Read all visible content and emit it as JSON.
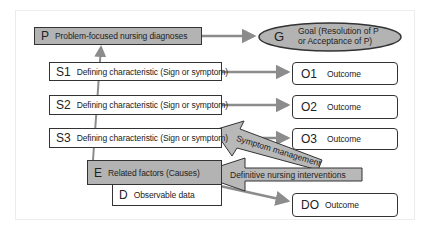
{
  "problem": {
    "code": "P",
    "label": "Problem-focused nursing diagnoses"
  },
  "goal": {
    "code": "G",
    "line1": "Goal (Resolution of P",
    "line2": "or Acceptance of P)"
  },
  "signs": [
    {
      "code": "S1",
      "label": "Defining characteristic (Sign or symptom)"
    },
    {
      "code": "S2",
      "label": "Defining characteristic (Sign or symptom)"
    },
    {
      "code": "S3",
      "label": "Defining characteristic (Sign or symptom)"
    }
  ],
  "outcomes": [
    {
      "code": "O1",
      "label": "Outcome"
    },
    {
      "code": "O2",
      "label": "Outcome"
    },
    {
      "code": "O3",
      "label": "Outcome"
    },
    {
      "code": "DO",
      "label": "Outcome"
    }
  ],
  "etiology": {
    "code": "E",
    "label": "Related factors (Causes)"
  },
  "data": {
    "code": "D",
    "label": "Observable data"
  },
  "interventions": {
    "symptom": "Symptom management",
    "definitive": "Definitive nursing interventions"
  },
  "colors": {
    "gray_fill": "#b3b3b3",
    "arrow_gray": "#8c8c8c",
    "border": "#333333"
  }
}
